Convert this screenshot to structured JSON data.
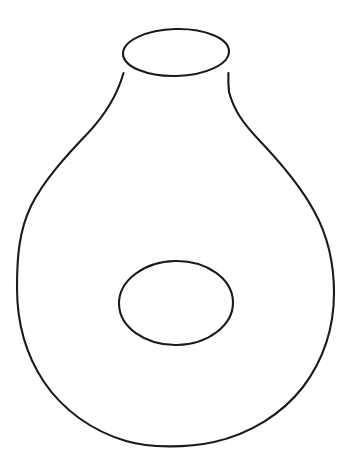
{
  "document": {
    "title": "Vase Outline Line Drawing",
    "kind": "line-drawing",
    "background_color": "#ffffff",
    "width": 352,
    "height": 469
  },
  "figure": {
    "name": "vessel-with-circular-opening",
    "stroke_color": "#1a1a1a",
    "fill_color": "none",
    "stroke_width": 2.1
  },
  "shapes": {
    "body": {
      "name": "vase-body-outline",
      "label": "Vase body contour",
      "stroke_color": "#1a1a1a",
      "stroke_width": 2.1,
      "bounds": {
        "x_min": 17,
        "x_max": 334,
        "y_min": 72,
        "y_max": 446
      },
      "path": "M 123.5 73 C 117 96 104 116 88 133 C 66 156 44 180 31 206 C 19 231 17 257 17 288 C 17 322 26 355 44 382 C 63 410 92 431 126 441 C 150 448 186 448 214 442 C 250 434 282 414 303 387 C 324 359 334 326 334 293 C 334 262 328 236 314 211 C 300 185 279 161 259 140 C 242 122 234 110 229 92 C 228.4 86 228.2 79 228.4 73"
    },
    "mouth": {
      "name": "vase-mouth-ellipse",
      "label": "Mouth opening",
      "stroke_color": "#1a1a1a",
      "stroke_width": 2.1,
      "cx": 176,
      "cy": 52.5,
      "rx": 53,
      "ry": 23.5,
      "rotation": -1.5
    },
    "hole": {
      "name": "vase-hole-ellipse",
      "label": "Circular hole on body",
      "stroke_color": "#1a1a1a",
      "stroke_width": 2.1,
      "cx": 176,
      "cy": 303,
      "rx": 57,
      "ry": 42,
      "rotation": -1
    }
  }
}
